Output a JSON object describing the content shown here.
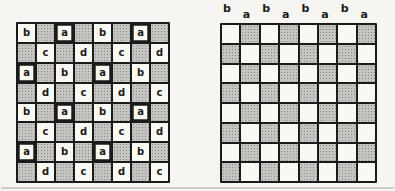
{
  "colors": {
    "paper": "#f6f5f1",
    "ink": "#1a1a1a",
    "cell_light": "#faf8f3",
    "cell_shade": "#c6c4c0",
    "shade_dot": "#8d8b87",
    "rule_line": "#cfccc5"
  },
  "left_board": {
    "shaded_marker": ".",
    "bold_letter": "a",
    "grid": [
      [
        "b",
        ".",
        "a",
        ".",
        "b",
        ".",
        "a",
        "."
      ],
      [
        ".",
        "c",
        ".",
        "d",
        ".",
        "c",
        ".",
        "d"
      ],
      [
        "a",
        ".",
        "b",
        ".",
        "a",
        ".",
        "b",
        "."
      ],
      [
        ".",
        "d",
        ".",
        "c",
        ".",
        "d",
        ".",
        "c"
      ],
      [
        "b",
        ".",
        "a",
        ".",
        "b",
        ".",
        "a",
        "."
      ],
      [
        ".",
        "c",
        ".",
        "d",
        ".",
        "c",
        ".",
        "d"
      ],
      [
        "a",
        ".",
        "b",
        ".",
        "a",
        ".",
        "b",
        "."
      ],
      [
        ".",
        "d",
        ".",
        "c",
        ".",
        "d",
        ".",
        "c"
      ]
    ]
  },
  "right_board": {
    "rows": 8,
    "cols": 8,
    "top_left_cell": "light",
    "top_labels": [
      {
        "text": "b",
        "raised": true
      },
      {
        "text": "a",
        "raised": false
      },
      {
        "text": "b",
        "raised": true
      },
      {
        "text": "a",
        "raised": false
      },
      {
        "text": "b",
        "raised": true
      },
      {
        "text": "a",
        "raised": false
      },
      {
        "text": "b",
        "raised": true
      },
      {
        "text": "a",
        "raised": false
      }
    ]
  }
}
